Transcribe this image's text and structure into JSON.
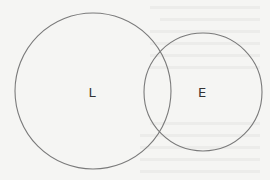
{
  "diagram": {
    "type": "venn",
    "sets": [
      {
        "label": "L",
        "cx": 93,
        "cy": 91,
        "r": 78
      },
      {
        "label": "E",
        "cx": 203,
        "cy": 92,
        "r": 59
      }
    ],
    "stroke_color": "#7a7a7a",
    "background_color": "#f5f5f3"
  }
}
